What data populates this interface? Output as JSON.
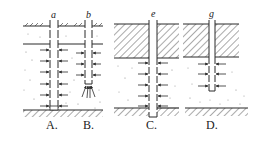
{
  "diagram": {
    "colors": {
      "line": "#2a2a2a",
      "background": "#ffffff",
      "sand_dots": "#8a8a8a"
    },
    "panels": [
      {
        "id": "A",
        "label": "A.",
        "well_label": "a",
        "type": "fully penetrating well, unconfined aquifer"
      },
      {
        "id": "B",
        "label": "B.",
        "well_label": "b",
        "type": "partially penetrating well, unconfined aquifer"
      },
      {
        "id": "C",
        "label": "C.",
        "well_label": "e",
        "type": "fully penetrating well, confined aquifer"
      },
      {
        "id": "D",
        "label": "D.",
        "well_label": "g",
        "type": "partially penetrating well, confined aquifer"
      }
    ]
  }
}
